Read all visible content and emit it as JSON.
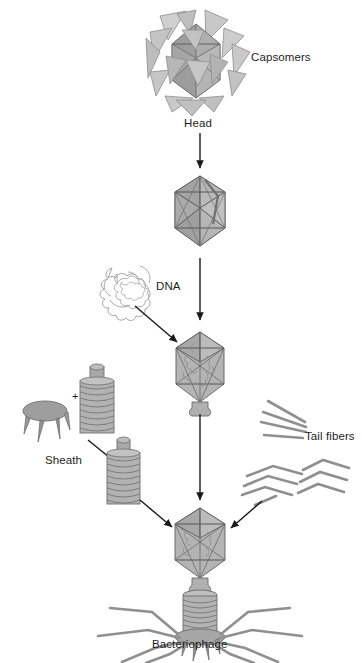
{
  "figure": {
    "title_text": "",
    "background_color": "#ffffff",
    "line_color": "#6b6b6b",
    "fill_light": "#d8d8d8",
    "fill_mid": "#b9b9b9",
    "fill_dark": "#9a9a9a",
    "arrow_color": "#1a1a1a",
    "text_color": "#1d1d1d"
  },
  "labels": {
    "capsomers": "Capsomers",
    "head": "Head",
    "dna": "DNA",
    "sheath": "Sheath",
    "tail_fibers": "Tail fibers",
    "bacteriophage": "Bacteriophage",
    "plus_sign": "+"
  },
  "stages": [
    {
      "id": "capsomers-cluster",
      "label": "Capsomers",
      "description": "scattered triangular capsomer subunits around forming head"
    },
    {
      "id": "head-capsid",
      "label": "Head",
      "description": "assembled empty icosahedral capsid"
    },
    {
      "id": "dna-coil",
      "label": "DNA",
      "description": "loose coiled DNA molecule"
    },
    {
      "id": "head-with-dna",
      "label": "",
      "description": "capsid filled with DNA, tail stub at base"
    },
    {
      "id": "baseplate-and-sheath",
      "label": "Sheath",
      "description": "baseplate plus sheath tube combine into tail sheath"
    },
    {
      "id": "tail-fibers-loose",
      "label": "Tail fibers",
      "description": "loose straight and bent tail fiber rods"
    },
    {
      "id": "bacteriophage",
      "label": "Bacteriophage",
      "description": "complete assembled T-even bacteriophage"
    }
  ],
  "arrows": [
    {
      "from": "capsomers-cluster",
      "to": "head-capsid",
      "direction": "down"
    },
    {
      "from": "head-capsid",
      "to": "head-with-dna",
      "direction": "down"
    },
    {
      "from": "dna-coil",
      "to": "head-with-dna",
      "direction": "down-right"
    },
    {
      "from": "baseplate-and-sheath",
      "to": "sheath-assembled",
      "direction": "down-right"
    },
    {
      "from": "sheath-assembled",
      "to": "bacteriophage",
      "direction": "down-right"
    },
    {
      "from": "head-with-dna",
      "to": "bacteriophage",
      "direction": "down"
    },
    {
      "from": "tail-fibers-loose",
      "to": "bacteriophage",
      "direction": "down-left"
    }
  ]
}
